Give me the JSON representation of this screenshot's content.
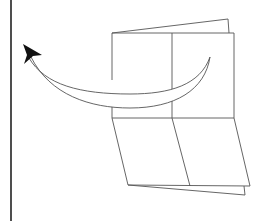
{
  "diagram": {
    "colors": {
      "background": "#ffffff",
      "outline": "#555555",
      "border": "#222222",
      "arrowhead": "#111111"
    },
    "elements": [
      {
        "name": "left-border-line"
      },
      {
        "name": "back-flap-top"
      },
      {
        "name": "top-panel"
      },
      {
        "name": "bottom-panel-skewed"
      },
      {
        "name": "back-flap-bottom"
      },
      {
        "name": "curved-arrow"
      }
    ]
  }
}
